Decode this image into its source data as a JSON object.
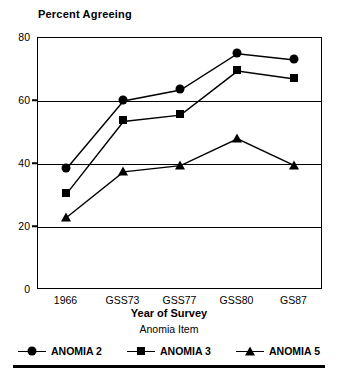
{
  "chart_data": {
    "type": "line",
    "title": "Percent Agreeing",
    "xlabel": "Year of Survey",
    "ylabel": "",
    "categories": [
      "1966",
      "GSS73",
      "GSS77",
      "GSS80",
      "GS87"
    ],
    "series": [
      {
        "name": "ANOMIA 2",
        "marker": "circle",
        "values": [
          38.5,
          60.0,
          63.5,
          75.0,
          73.0
        ]
      },
      {
        "name": "ANOMIA 3",
        "marker": "square",
        "values": [
          30.5,
          53.5,
          55.5,
          69.5,
          67.0
        ]
      },
      {
        "name": "ANOMIA 5",
        "marker": "triangle",
        "values": [
          23.0,
          37.5,
          39.5,
          48.0,
          39.5
        ]
      }
    ],
    "ylim": [
      0,
      80
    ],
    "yticks": [
      0,
      20,
      40,
      60,
      80
    ],
    "gridlines": [
      20,
      40,
      60
    ],
    "grid": true,
    "legend_title": "Anomia Item",
    "legend_position": "bottom"
  },
  "legend": {
    "title": "Anomia Item",
    "entries": [
      {
        "label": "ANOMIA 2",
        "icon": "circle-marker-icon"
      },
      {
        "label": "ANOMIA 3",
        "icon": "square-marker-icon"
      },
      {
        "label": "ANOMIA 5",
        "icon": "triangle-marker-icon"
      }
    ]
  }
}
